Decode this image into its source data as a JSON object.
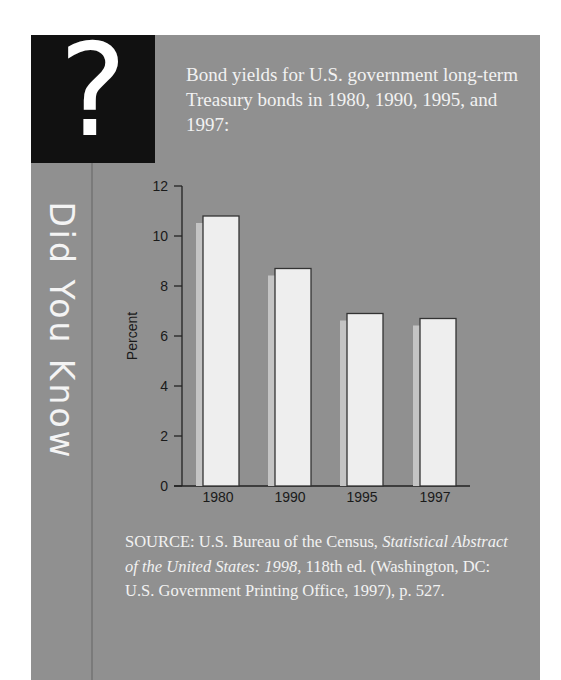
{
  "sidebar": {
    "icon": "question-mark-icon",
    "icon_glyph": "?",
    "title": "Did You Know"
  },
  "intro": {
    "text": "Bond yields for U.S. government long-term Treasury bonds in 1980, 1990, 1995, and 1997:"
  },
  "colors": {
    "panel": "#909090",
    "icon_box": "#111111",
    "bar_fill": "#eeeeee",
    "bar_shadow": "#c4c4c4",
    "bar_stroke": "#333333",
    "axis": "#222222"
  },
  "chart_data": {
    "type": "bar",
    "title": "Bond yields for U.S. government long-term Treasury bonds in 1980, 1990, 1995, and 1997",
    "categories": [
      "1980",
      "1990",
      "1995",
      "1997"
    ],
    "values": [
      10.8,
      8.7,
      6.9,
      6.7
    ],
    "xlabel": "",
    "ylabel": "Percent",
    "ylim": [
      0,
      12
    ],
    "yticks": [
      "0",
      "2",
      "4",
      "6",
      "8",
      "10",
      "12"
    ],
    "grid": false,
    "legend": "none"
  },
  "source": {
    "prefix": "SOURCE: U.S. Bureau of the Census, ",
    "title_italic": "Statistical Abstract of the United States: 1998,",
    "suffix": " 118th ed. (Washington, DC: U.S. Government Printing Office, 1997), p. 527."
  }
}
